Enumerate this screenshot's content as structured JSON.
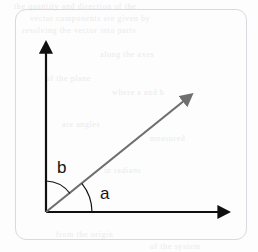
{
  "figure": {
    "type": "geometry-diagram",
    "card": {
      "border_color": "#d7dade",
      "corner_radius": 11,
      "background": "#fdfdfd"
    },
    "axes": {
      "color": "#101010",
      "stroke_width": 2,
      "origin": {
        "x": 46,
        "y": 212
      },
      "vertical": {
        "from": {
          "x": 46,
          "y": 212
        },
        "to": {
          "x": 46,
          "y": 43
        },
        "arrowhead": "up"
      },
      "horizontal": {
        "from": {
          "x": 46,
          "y": 212
        },
        "to": {
          "x": 228,
          "y": 212
        },
        "arrowhead": "right"
      }
    },
    "ray": {
      "color": "#6f6f6f",
      "stroke_width": 2,
      "from": {
        "x": 46,
        "y": 212
      },
      "to": {
        "x": 192,
        "y": 94
      },
      "arrowhead": "pointing-up-right",
      "angle_from_horizontal_deg": 39
    },
    "angles": [
      {
        "label": "b",
        "arc_radius": 31,
        "measured_from": "vertical-axis",
        "measured_to": "ray",
        "value_deg": 51,
        "label_position": {
          "x": 57,
          "y": 159
        },
        "color": "#141414"
      },
      {
        "label": "a",
        "arc_radius": 46,
        "measured_from": "horizontal-axis",
        "measured_to": "ray",
        "value_deg": 39,
        "label_position": {
          "x": 100,
          "y": 185
        },
        "color": "#141414"
      }
    ]
  },
  "background_artifacts": {
    "note": "faint bleed-through text from reverse of scanned page",
    "color": "#d9dbe0",
    "lines": [
      {
        "text": "the quantity and direction of the",
        "x": 14,
        "y": 2
      },
      {
        "text": "vector components are given by",
        "x": 30,
        "y": 14
      },
      {
        "text": "resolving the vector into parts",
        "x": 22,
        "y": 26
      },
      {
        "text": "along the axes",
        "x": 100,
        "y": 50
      },
      {
        "text": "of the plane",
        "x": 46,
        "y": 74
      },
      {
        "text": "where a and b",
        "x": 112,
        "y": 88
      },
      {
        "text": "are angles",
        "x": 62,
        "y": 120
      },
      {
        "text": "measured",
        "x": 150,
        "y": 134
      },
      {
        "text": "in radians",
        "x": 104,
        "y": 166
      },
      {
        "text": "from the origin",
        "x": 56,
        "y": 230
      },
      {
        "text": "of the system",
        "x": 150,
        "y": 242
      }
    ]
  }
}
